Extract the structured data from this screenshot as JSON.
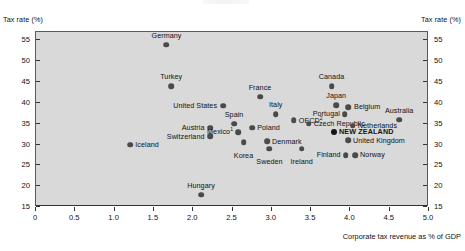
{
  "labels": {
    "corner_left": "Tax rate (%)",
    "corner_right": "Tax rate (%)",
    "xaxis_label": "Corporate tax revenue as % of GDP"
  },
  "chart_data": {
    "type": "scatter",
    "title": "",
    "xlabel": "Corporate tax revenue as % of GDP",
    "ylabel": "Tax rate (%)",
    "xlim": [
      0,
      5.0
    ],
    "ylim": [
      15,
      57
    ],
    "grid": false,
    "legend": null,
    "xticks": [
      "0",
      "0.5",
      "1.0",
      "1.5",
      "2.0",
      "2.5",
      "3.0",
      "3.5",
      "4.0",
      "4.5",
      "5.0"
    ],
    "xtick_values": [
      0,
      0.5,
      1.0,
      1.5,
      2.0,
      2.5,
      3.0,
      3.5,
      4.0,
      4.5,
      5.0
    ],
    "yticks": [
      "15",
      "20",
      "25",
      "30",
      "35",
      "40",
      "45",
      "50",
      "55"
    ],
    "ytick_values": [
      15,
      20,
      25,
      30,
      35,
      40,
      45,
      50,
      55
    ],
    "yticks_both_sides": true,
    "marker_color": "#4a4a4a",
    "highlight_color": "#141414",
    "plot_background": "#d9d9d9",
    "footnotes": [
      "1",
      "2"
    ],
    "points": [
      {
        "name": "Germany",
        "x": 1.66,
        "y": 54.0,
        "label": "Germany",
        "lx": 0,
        "ly": -9,
        "align": "center",
        "highlight": false
      },
      {
        "name": "Turkey",
        "x": 1.72,
        "y": 44.0,
        "label": "Turkey",
        "lx": 0,
        "ly": -9,
        "align": "center",
        "highlight": false
      },
      {
        "name": "United States",
        "x": 2.38,
        "y": 39.3,
        "label": "United States",
        "lx": -6,
        "ly": 0,
        "align": "right",
        "highlight": false
      },
      {
        "name": "France",
        "x": 2.85,
        "y": 41.5,
        "label": "France",
        "lx": 0,
        "ly": -9,
        "align": "center",
        "highlight": false
      },
      {
        "name": "Canada",
        "x": 3.76,
        "y": 44.0,
        "label": "Canada",
        "lx": 0,
        "ly": -9,
        "align": "center",
        "highlight": false
      },
      {
        "name": "Japan",
        "x": 3.82,
        "y": 39.5,
        "label": "Japan",
        "lx": 0,
        "ly": -9,
        "align": "center",
        "highlight": false
      },
      {
        "name": "Belgium",
        "x": 3.97,
        "y": 39.0,
        "label": "Belgium",
        "lx": 6,
        "ly": 0,
        "align": "left",
        "highlight": false
      },
      {
        "name": "Portugal",
        "x": 3.93,
        "y": 37.3,
        "label": "Portugal",
        "lx": -5,
        "ly": 0,
        "align": "right",
        "highlight": false
      },
      {
        "name": "Italy",
        "x": 3.05,
        "y": 37.3,
        "label": "Italy",
        "lx": 0,
        "ly": -9,
        "align": "center",
        "highlight": false
      },
      {
        "name": "Spain",
        "x": 2.52,
        "y": 35.0,
        "label": "Spain",
        "lx": 0,
        "ly": -9,
        "align": "center",
        "highlight": false
      },
      {
        "name": "OECD",
        "x": 3.28,
        "y": 35.8,
        "label": "OECD",
        "lx": 5,
        "ly": 0,
        "align": "left",
        "highlight": false,
        "sup": "2"
      },
      {
        "name": "Czech Republic",
        "x": 3.47,
        "y": 35.0,
        "label": "Czech Republic",
        "lx": 5,
        "ly": 0,
        "align": "left",
        "highlight": false
      },
      {
        "name": "Netherlands",
        "x": 4.03,
        "y": 34.5,
        "label": "Netherlands",
        "lx": 5,
        "ly": 0,
        "align": "left",
        "highlight": false
      },
      {
        "name": "Australia",
        "x": 4.62,
        "y": 36.0,
        "label": "Australia",
        "lx": 0,
        "ly": -9,
        "align": "center",
        "highlight": false
      },
      {
        "name": "Austria",
        "x": 2.22,
        "y": 34.0,
        "label": "Austria",
        "lx": -6,
        "ly": 0,
        "align": "right",
        "highlight": false
      },
      {
        "name": "Switzerland",
        "x": 2.22,
        "y": 32.0,
        "label": "Switzerland",
        "lx": -6,
        "ly": 0,
        "align": "right",
        "highlight": false
      },
      {
        "name": "Mexico",
        "x": 2.57,
        "y": 33.0,
        "label": "Mexico",
        "lx": -5,
        "ly": 0,
        "align": "right",
        "highlight": false,
        "sup": "1"
      },
      {
        "name": "Poland",
        "x": 2.75,
        "y": 34.0,
        "label": "Poland",
        "lx": 5,
        "ly": 0,
        "align": "left",
        "highlight": false
      },
      {
        "name": "Korea",
        "x": 2.64,
        "y": 30.5,
        "label": "Korea",
        "lx": 0,
        "ly": 9,
        "align": "center",
        "highlight": false
      },
      {
        "name": "Denmark",
        "x": 2.94,
        "y": 30.8,
        "label": "Denmark",
        "lx": 5,
        "ly": 0,
        "align": "left",
        "highlight": false
      },
      {
        "name": "Sweden",
        "x": 2.97,
        "y": 29.0,
        "label": "Sweden",
        "lx": 0,
        "ly": 9,
        "align": "center",
        "highlight": false
      },
      {
        "name": "Ireland",
        "x": 3.38,
        "y": 29.0,
        "label": "Ireland",
        "lx": 0,
        "ly": 9,
        "align": "center",
        "highlight": false
      },
      {
        "name": "Iceland",
        "x": 1.2,
        "y": 30.0,
        "label": "Iceland",
        "lx": 5,
        "ly": 0,
        "align": "left",
        "highlight": false
      },
      {
        "name": "NEW ZEALAND",
        "x": 3.79,
        "y": 33.0,
        "label": "NEW ZEALAND",
        "lx": 5,
        "ly": 0,
        "align": "left",
        "highlight": true
      },
      {
        "name": "United Kingdom",
        "x": 3.97,
        "y": 31.0,
        "label": "United Kingdom",
        "lx": 5,
        "ly": 0,
        "align": "left",
        "highlight": false
      },
      {
        "name": "Finland",
        "x": 3.94,
        "y": 27.5,
        "label": "Finland",
        "lx": -5,
        "ly": 0,
        "align": "right",
        "highlight": false
      },
      {
        "name": "Norway",
        "x": 4.06,
        "y": 27.5,
        "label": "Norway",
        "lx": 5,
        "ly": 0,
        "align": "left",
        "highlight": false
      },
      {
        "name": "Hungary",
        "x": 2.1,
        "y": 18.0,
        "label": "Hungary",
        "lx": 0,
        "ly": -9,
        "align": "center",
        "highlight": false
      }
    ]
  }
}
